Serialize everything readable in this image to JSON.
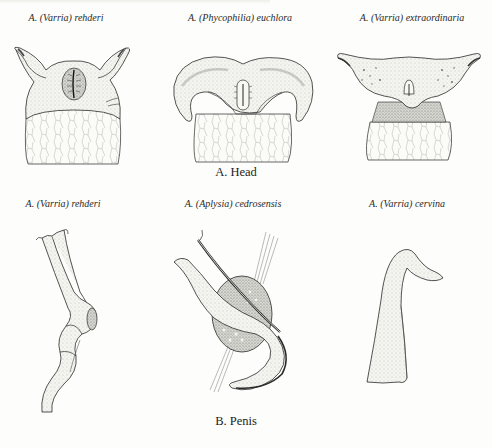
{
  "figure": {
    "section_a": {
      "title": "A. Head",
      "panels": [
        {
          "prefix": "A. (",
          "subgenus": "Varria",
          "suffix": ") rehderi",
          "subject": "head"
        },
        {
          "prefix": "A. (",
          "subgenus": "Phycophilia",
          "suffix": ") euchlora",
          "subject": "head"
        },
        {
          "prefix": "A. (",
          "subgenus": "Varria",
          "suffix": ") extraordinaria",
          "subject": "head"
        }
      ]
    },
    "section_b": {
      "title": "B. Penis",
      "panels": [
        {
          "prefix": "A. (",
          "subgenus": "Varria",
          "suffix": ") rehderi",
          "subject": "penis"
        },
        {
          "prefix": "A. (",
          "subgenus": "Aplysia",
          "suffix": ") cedrosensis",
          "subject": "penis"
        },
        {
          "prefix": "A. (",
          "subgenus": "Varria",
          "suffix": ") cervina",
          "subject": "penis"
        }
      ]
    }
  },
  "colors": {
    "ink": "#2a2a2a",
    "paper": "#fdfdfb",
    "stipple": "#9a9a94"
  }
}
